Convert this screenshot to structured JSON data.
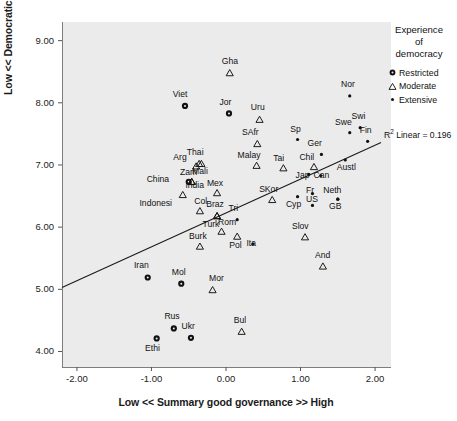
{
  "chart_data": {
    "type": "scatter",
    "title": "",
    "xlabel": "Low << Summary good governance >> High",
    "ylabel": "Low << Democratic satisfaction >> High",
    "xlim": [
      -2.2,
      2.2
    ],
    "ylim": [
      3.75,
      9.3
    ],
    "xticks": [
      "-2.00",
      "-1.00",
      "0.00",
      "1.00",
      "2.00"
    ],
    "xtick_values": [
      -2,
      -1,
      0,
      1,
      2
    ],
    "yticks": [
      "4.00",
      "5.00",
      "6.00",
      "7.00",
      "8.00",
      "9.00"
    ],
    "ytick_values": [
      4,
      5,
      6,
      7,
      8,
      9
    ],
    "grid": false,
    "legend": {
      "title": "Experience\nof\ndemocracy",
      "title_lines": [
        "Experience",
        "of",
        "democracy"
      ],
      "position": "right",
      "entries": [
        {
          "label": "Restricted",
          "marker": "filled-circle"
        },
        {
          "label": "Moderate",
          "marker": "open-triangle"
        },
        {
          "label": "Extensive",
          "marker": "small-dot"
        }
      ]
    },
    "annotation": {
      "r2_prefix": "R",
      "r2_sup": "2",
      "r2_text": " Linear = 0.196",
      "full": "R2 Linear = 0.196"
    },
    "fit_line": {
      "type": "linear",
      "x_start": -2.2,
      "y_start": 5.03,
      "x_end": 2.08,
      "y_end": 7.36,
      "r_squared": 0.196
    },
    "series": [
      {
        "name": "Restricted",
        "marker": "filled-circle",
        "points": [
          {
            "label": "Viet",
            "x": -0.55,
            "y": 7.95,
            "lx": -0.6,
            "ly": 8.12
          },
          {
            "label": "Jor",
            "x": 0.04,
            "y": 7.83,
            "lx": 0.0,
            "ly": 8.0
          },
          {
            "label": "China",
            "x": -0.5,
            "y": 6.73,
            "lx": -0.92,
            "ly": 6.76
          },
          {
            "label": "Iran",
            "x": -1.05,
            "y": 5.19,
            "lx": -1.12,
            "ly": 5.38
          },
          {
            "label": "Mol",
            "x": -0.6,
            "y": 5.09,
            "lx": -0.64,
            "ly": 5.27
          },
          {
            "label": "Rus",
            "x": -0.7,
            "y": 4.37,
            "lx": -0.74,
            "ly": 4.55
          },
          {
            "label": "Ukr",
            "x": -0.47,
            "y": 4.22,
            "lx": -0.51,
            "ly": 4.4
          },
          {
            "label": "Ethi",
            "x": -0.93,
            "y": 4.21,
            "lx": -0.97,
            "ly": 4.04
          }
        ]
      },
      {
        "name": "Moderate",
        "marker": "open-triangle",
        "points": [
          {
            "label": "Gha",
            "x": 0.05,
            "y": 8.48,
            "lx": 0.03,
            "ly": 8.66
          },
          {
            "label": "Uru",
            "x": 0.45,
            "y": 7.73,
            "lx": 0.42,
            "ly": 7.91
          },
          {
            "label": "SAfr",
            "x": 0.42,
            "y": 7.34,
            "lx": 0.33,
            "ly": 7.52
          },
          {
            "label": "Thai",
            "x": -0.36,
            "y": 7.02,
            "lx": -0.41,
            "ly": 7.2
          },
          {
            "label": "Arg",
            "x": -0.4,
            "y": 6.98,
            "lx": -0.62,
            "ly": 7.12
          },
          {
            "label": "Mali",
            "x": -0.33,
            "y": 7.02,
            "lx": -0.34,
            "ly": 6.88
          },
          {
            "label": "Malay",
            "x": 0.41,
            "y": 6.99,
            "lx": 0.3,
            "ly": 7.14
          },
          {
            "label": "Tai",
            "x": 0.77,
            "y": 6.95,
            "lx": 0.72,
            "ly": 7.1
          },
          {
            "label": "Chil",
            "x": 1.18,
            "y": 6.97,
            "lx": 1.1,
            "ly": 7.12
          },
          {
            "label": "Zam",
            "x": -0.46,
            "y": 6.73,
            "lx": -0.53,
            "ly": 6.87
          },
          {
            "label": "India",
            "x": -0.46,
            "y": 6.73,
            "lx": -0.4,
            "ly": 6.66
          },
          {
            "label": "Mex",
            "x": -0.12,
            "y": 6.55,
            "lx": -0.17,
            "ly": 6.7
          },
          {
            "label": "Indonesi",
            "x": -0.58,
            "y": 6.52,
            "lx": -0.93,
            "ly": 6.38
          },
          {
            "label": "SKor",
            "x": 0.62,
            "y": 6.44,
            "lx": 0.56,
            "ly": 6.59
          },
          {
            "label": "Col",
            "x": -0.35,
            "y": 6.26,
            "lx": -0.34,
            "ly": 6.4
          },
          {
            "label": "Braz",
            "x": -0.12,
            "y": 6.18,
            "lx": -0.15,
            "ly": 6.35
          },
          {
            "label": "Turk",
            "x": -0.12,
            "y": 6.18,
            "lx": -0.2,
            "ly": 6.04
          },
          {
            "label": "Rom",
            "x": -0.06,
            "y": 5.93,
            "lx": -0.02,
            "ly": 6.06
          },
          {
            "label": "Slov",
            "x": 1.06,
            "y": 5.84,
            "lx": 1.0,
            "ly": 6.0
          },
          {
            "label": "Pol",
            "x": 0.15,
            "y": 5.85,
            "lx": 0.13,
            "ly": 5.7
          },
          {
            "label": "Burk",
            "x": -0.35,
            "y": 5.69,
            "lx": -0.38,
            "ly": 5.84
          },
          {
            "label": "And",
            "x": 1.3,
            "y": 5.37,
            "lx": 1.28,
            "ly": 5.54
          },
          {
            "label": "Mor",
            "x": -0.18,
            "y": 4.99,
            "lx": -0.14,
            "ly": 5.16
          },
          {
            "label": "Bul",
            "x": 0.21,
            "y": 4.32,
            "lx": 0.19,
            "ly": 4.49
          }
        ]
      },
      {
        "name": "Extensive",
        "marker": "small-dot",
        "points": [
          {
            "label": "Nor",
            "x": 1.66,
            "y": 8.11,
            "lx": 1.63,
            "ly": 8.28
          },
          {
            "label": "Swi",
            "x": 1.8,
            "y": 7.6,
            "lx": 1.77,
            "ly": 7.77
          },
          {
            "label": "Swe",
            "x": 1.66,
            "y": 7.52,
            "lx": 1.55,
            "ly": 7.67
          },
          {
            "label": "Fin",
            "x": 1.9,
            "y": 7.38,
            "lx": 1.88,
            "ly": 7.54
          },
          {
            "label": "Sp",
            "x": 0.96,
            "y": 7.41,
            "lx": 0.92,
            "ly": 7.56
          },
          {
            "label": "Ger",
            "x": 1.28,
            "y": 7.17,
            "lx": 1.18,
            "ly": 7.33
          },
          {
            "label": "Austl",
            "x": 1.6,
            "y": 7.08,
            "lx": 1.63,
            "ly": 6.95
          },
          {
            "label": "Jap",
            "x": 1.11,
            "y": 6.85,
            "lx": 1.02,
            "ly": 6.82
          },
          {
            "label": "Can",
            "x": 1.27,
            "y": 6.83,
            "lx": 1.26,
            "ly": 6.82
          },
          {
            "label": "Fr",
            "x": 1.16,
            "y": 6.54,
            "lx": 1.13,
            "ly": 6.58
          },
          {
            "label": "Neth",
            "x": 1.5,
            "y": 6.45,
            "lx": 1.42,
            "ly": 6.58
          },
          {
            "label": "Cyp",
            "x": 0.96,
            "y": 6.49,
            "lx": 0.89,
            "ly": 6.36
          },
          {
            "label": "US",
            "x": 1.16,
            "y": 6.35,
            "lx": 1.13,
            "ly": 6.44
          },
          {
            "label": "GB",
            "x": 1.5,
            "y": 6.45,
            "lx": 1.44,
            "ly": 6.32
          },
          {
            "label": "Tri",
            "x": 0.15,
            "y": 6.12,
            "lx": 0.12,
            "ly": 6.29
          },
          {
            "label": "Ita",
            "x": 0.36,
            "y": 5.73,
            "lx": 0.36,
            "ly": 5.73
          }
        ]
      }
    ]
  }
}
